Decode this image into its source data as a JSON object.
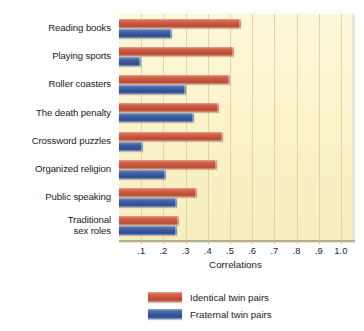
{
  "chart_data": {
    "type": "bar",
    "orientation": "horizontal",
    "title": "",
    "xlabel": "Correlations",
    "ylabel": "",
    "xlim": [
      0,
      1.05
    ],
    "grid": true,
    "legend_position": "bottom",
    "tick_labels": [
      ".1",
      ".2",
      ".3",
      ".4",
      ".5",
      ".6",
      ".7",
      ".8",
      ".9",
      "1.0"
    ],
    "tick_values": [
      0.1,
      0.2,
      0.3,
      0.4,
      0.5,
      0.6,
      0.7,
      0.8,
      0.9,
      1.0
    ],
    "categories": [
      "Reading books",
      "Playing sports",
      "Roller coasters",
      "The death penalty",
      "Crossword puzzles",
      "Organized religion",
      "Public speaking",
      "Traditional\nsex roles"
    ],
    "series": [
      {
        "name": "Identical twin pairs",
        "color": "#c4543c",
        "values": [
          0.55,
          0.52,
          0.5,
          0.45,
          0.47,
          0.44,
          0.35,
          0.27
        ]
      },
      {
        "name": "Fraternal twin pairs",
        "color": "#36569a",
        "values": [
          0.24,
          0.1,
          0.3,
          0.34,
          0.11,
          0.21,
          0.26,
          0.26
        ]
      }
    ]
  },
  "colors": {
    "plot_background": "#faf2c8",
    "gridline": "#e6d49c",
    "axis": "#b9ae8a",
    "text": "#1b1b1b",
    "identical": "#c4543c",
    "fraternal": "#36569a"
  }
}
